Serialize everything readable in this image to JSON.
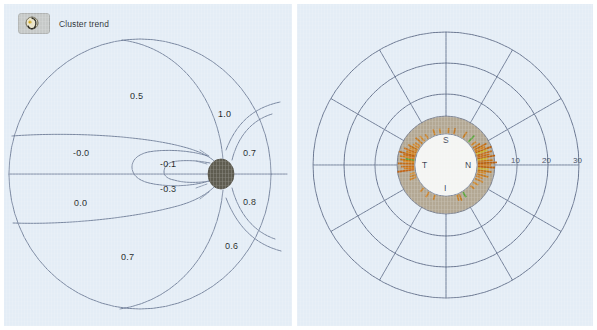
{
  "figure": {
    "panels": [
      {
        "id": "cluster-trend-map",
        "kind": "contour-map"
      },
      {
        "id": "tsnit-polar-plot",
        "kind": "polar"
      }
    ]
  },
  "legend": {
    "icon": "cluster-trend-icon",
    "label": "Cluster trend"
  },
  "colors": {
    "panel_background": "#e4edf6",
    "page_background": "#ffffff",
    "contour_line": "#6d7c96",
    "optic_disc": "#5e5c50",
    "polar_grid": "#5c6a86",
    "polar_annulus": "#b3a894",
    "polar_inner_disc": "#f3f4f2",
    "spike_orange": "#d97b18",
    "spike_dark_orange": "#b85f10",
    "spike_yellow": "#c9b02c",
    "spike_green": "#5aa43c",
    "label_text": "#1b1f26"
  },
  "chart_data": [
    {
      "type": "contour",
      "id": "cluster-trend-map",
      "title": "Cluster trend",
      "xlabel": "",
      "ylabel": "",
      "grid": false,
      "legend_position": "top-left",
      "annotations": [
        {
          "label": "0.5",
          "value": 0.5,
          "x": 126,
          "y": 93
        },
        {
          "label": "1.0",
          "value": 1.0,
          "x": 214,
          "y": 111
        },
        {
          "label": "-0.0",
          "value": -0.0,
          "x": 78,
          "y": 150
        },
        {
          "label": "0.7",
          "value": 0.7,
          "x": 243,
          "y": 150
        },
        {
          "label": "-0.1",
          "value": -0.1,
          "x": 165,
          "y": 161
        },
        {
          "label": "-0.3",
          "value": -0.3,
          "x": 165,
          "y": 186
        },
        {
          "label": "0.0",
          "value": 0.0,
          "x": 76,
          "y": 200
        },
        {
          "label": "0.8",
          "value": 0.8,
          "x": 243,
          "y": 199
        },
        {
          "label": "0.6",
          "value": 0.6,
          "x": 225,
          "y": 243
        },
        {
          "label": "0.7",
          "value": 0.7,
          "x": 123,
          "y": 254
        }
      ],
      "optic_disc": {
        "cx": 217,
        "cy": 170,
        "rx": 13,
        "ry": 15
      }
    },
    {
      "type": "polar",
      "id": "tsnit-polar-plot",
      "title": "",
      "center": {
        "x": 149,
        "y": 161
      },
      "grid": true,
      "legend_position": "none",
      "radial_ticks": [
        {
          "label": "10",
          "value": 10,
          "radius": 71
        },
        {
          "label": "20",
          "value": 20,
          "radius": 102
        },
        {
          "label": "30",
          "value": 30,
          "radius": 133
        }
      ],
      "quadrant_labels": [
        {
          "label": "S",
          "meaning": "superior",
          "x": 149,
          "y": 136
        },
        {
          "label": "T",
          "meaning": "temporal",
          "x": 128,
          "y": 161
        },
        {
          "label": "N",
          "meaning": "nasal",
          "x": 171,
          "y": 161
        },
        {
          "label": "I",
          "meaning": "inferior",
          "x": 149,
          "y": 184
        }
      ],
      "ring_radii": {
        "inner_disc": 31,
        "annulus_outer": 49,
        "circles": [
          49,
          71,
          102,
          133
        ]
      },
      "spoke_count": 12,
      "spoke_step_degrees": 30,
      "spikes": [
        {
          "angle": 248,
          "length": 7,
          "color": "#c8822c"
        },
        {
          "angle": 252,
          "length": 6,
          "color": "#c8822c"
        },
        {
          "angle": 256,
          "length": 5,
          "color": "#d08a2e"
        },
        {
          "angle": 262,
          "length": 17,
          "color": "#c0661a"
        },
        {
          "angle": 265,
          "length": 10,
          "color": "#d47b18"
        },
        {
          "angle": 268,
          "length": 13,
          "color": "#c87018"
        },
        {
          "angle": 272,
          "length": 16,
          "color": "#c46c16"
        },
        {
          "angle": 275,
          "length": 11,
          "color": "#d9881f"
        },
        {
          "angle": 277,
          "length": 14,
          "color": "#c47414"
        },
        {
          "angle": 279,
          "length": 9,
          "color": "#5aa43c"
        },
        {
          "angle": 281,
          "length": 15,
          "color": "#cf7a1a"
        },
        {
          "angle": 284,
          "length": 12,
          "color": "#c87018"
        },
        {
          "angle": 286,
          "length": 17,
          "color": "#bd6410"
        },
        {
          "angle": 289,
          "length": 10,
          "color": "#d3821c"
        },
        {
          "angle": 292,
          "length": 13,
          "color": "#c87018"
        },
        {
          "angle": 295,
          "length": 8,
          "color": "#cf8a30"
        },
        {
          "angle": 298,
          "length": 11,
          "color": "#c27216"
        },
        {
          "angle": 302,
          "length": 7,
          "color": "#d0882c"
        },
        {
          "angle": 306,
          "length": 6,
          "color": "#cb8430"
        },
        {
          "angle": 312,
          "length": 9,
          "color": "#c47a22"
        },
        {
          "angle": 318,
          "length": 7,
          "color": "#cf8a30"
        },
        {
          "angle": 326,
          "length": 5,
          "color": "#c8822c"
        },
        {
          "angle": 340,
          "length": 6,
          "color": "#c8822c"
        },
        {
          "angle": 350,
          "length": 5,
          "color": "#cb8a33"
        },
        {
          "angle": 4,
          "length": 5,
          "color": "#c8822c"
        },
        {
          "angle": 14,
          "length": 6,
          "color": "#c07828"
        },
        {
          "angle": 32,
          "length": 7,
          "color": "#c27c26"
        },
        {
          "angle": 44,
          "length": 9,
          "color": "#5aa43c"
        },
        {
          "angle": 52,
          "length": 6,
          "color": "#c8822c"
        },
        {
          "angle": 58,
          "length": 8,
          "color": "#c27216"
        },
        {
          "angle": 62,
          "length": 14,
          "color": "#c06c14"
        },
        {
          "angle": 65,
          "length": 11,
          "color": "#d3821c"
        },
        {
          "angle": 68,
          "length": 17,
          "color": "#bd6410"
        },
        {
          "angle": 70,
          "length": 12,
          "color": "#c9b02c"
        },
        {
          "angle": 73,
          "length": 16,
          "color": "#c46c16"
        },
        {
          "angle": 76,
          "length": 13,
          "color": "#c87018"
        },
        {
          "angle": 79,
          "length": 18,
          "color": "#bb620e"
        },
        {
          "angle": 81,
          "length": 10,
          "color": "#c9b02c"
        },
        {
          "angle": 84,
          "length": 15,
          "color": "#c47414"
        },
        {
          "angle": 87,
          "length": 19,
          "color": "#b85f10"
        },
        {
          "angle": 90,
          "length": 13,
          "color": "#cf7a1a"
        },
        {
          "angle": 93,
          "length": 17,
          "color": "#bd6410"
        },
        {
          "angle": 96,
          "length": 11,
          "color": "#c9b02c"
        },
        {
          "angle": 99,
          "length": 14,
          "color": "#c27216"
        },
        {
          "angle": 102,
          "length": 9,
          "color": "#d0882c"
        },
        {
          "angle": 106,
          "length": 12,
          "color": "#c47a22"
        },
        {
          "angle": 110,
          "length": 7,
          "color": "#cb8430"
        },
        {
          "angle": 115,
          "length": 9,
          "color": "#c8822c"
        },
        {
          "angle": 122,
          "length": 6,
          "color": "#cf8a30"
        },
        {
          "angle": 130,
          "length": 5,
          "color": "#c8822c"
        },
        {
          "angle": 148,
          "length": 6,
          "color": "#5aa43c"
        },
        {
          "angle": 156,
          "length": 7,
          "color": "#c27c26"
        },
        {
          "angle": 160,
          "length": 6,
          "color": "#c8822c"
        },
        {
          "angle": 200,
          "length": 5,
          "color": "#c8822c"
        },
        {
          "angle": 212,
          "length": 6,
          "color": "#cb8430"
        },
        {
          "angle": 224,
          "length": 5,
          "color": "#c8822c"
        }
      ]
    }
  ]
}
